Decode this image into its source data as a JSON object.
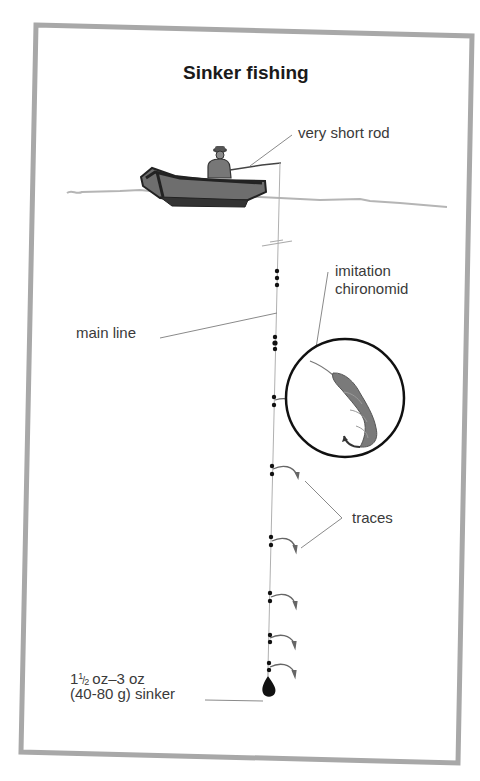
{
  "diagram": {
    "title": "Sinker fishing",
    "colors": {
      "frame": "#a8a8a8",
      "label_text": "#3a3a3a",
      "title_text": "#1a1a1a",
      "leader_line": "#8a8a8a",
      "boat_fill": "#6e6e6e",
      "boat_dark": "#2e2e2e",
      "water_line": "#b5b5b5",
      "lure_fill": "#7a7a7a"
    },
    "labels": {
      "rod": "very short rod",
      "lure_line1": "imitation",
      "lure_line2": "chironomid",
      "main_line": "main line",
      "traces": "traces",
      "sinker_whole": "1",
      "sinker_frac_num": "1",
      "sinker_frac_den": "2",
      "sinker_line1_rest": "oz–3 oz",
      "sinker_line2": "(40-80 g) sinker"
    },
    "components": [
      {
        "name": "boat with angler",
        "icon": "boat-icon"
      },
      {
        "name": "very short rod",
        "icon": "rod-icon"
      },
      {
        "name": "main line",
        "icon": "line-icon"
      },
      {
        "name": "imitation chironomid (magnified)",
        "icon": "chironomid-icon"
      },
      {
        "name": "traces",
        "count": 7,
        "icon": "trace-hook-icon"
      },
      {
        "name": "sinker",
        "weight": "1½ oz–3 oz (40-80 g)",
        "icon": "sinker-icon"
      }
    ]
  }
}
